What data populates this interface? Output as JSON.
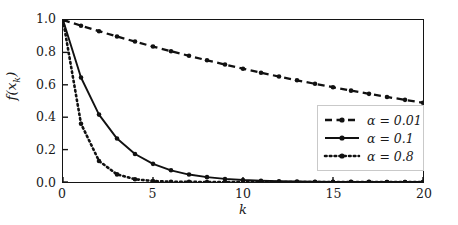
{
  "chart_data": {
    "type": "line",
    "title": "",
    "xlabel": "k",
    "ylabel": "f(x_k)",
    "ylabel_base": "f(x",
    "ylabel_sub": "k",
    "ylabel_tail": ")",
    "xlim": [
      0,
      20
    ],
    "ylim": [
      0.0,
      1.0
    ],
    "grid": false,
    "legend_position": "lower right",
    "xticks": [
      0,
      5,
      10,
      15,
      20
    ],
    "xtick_labels": [
      "0",
      "5",
      "10",
      "15",
      "20"
    ],
    "yticks": [
      0.0,
      0.2,
      0.4,
      0.6,
      0.8,
      1.0
    ],
    "ytick_labels": [
      "0.0",
      "0.2",
      "0.4",
      "0.6",
      "0.8",
      "1.0"
    ],
    "x": [
      0,
      1,
      2,
      3,
      4,
      5,
      6,
      7,
      8,
      9,
      10,
      11,
      12,
      13,
      14,
      15,
      16,
      17,
      18,
      19,
      20
    ],
    "series": [
      {
        "name": "alpha = 0.01",
        "legend_label": "α = 0.01",
        "linestyle": "dashed",
        "marker": "circle",
        "color": "#111111",
        "values": [
          1.0,
          0.965,
          0.931,
          0.898,
          0.867,
          0.836,
          0.807,
          0.779,
          0.751,
          0.725,
          0.699,
          0.675,
          0.651,
          0.628,
          0.606,
          0.585,
          0.564,
          0.544,
          0.525,
          0.507,
          0.489
        ]
      },
      {
        "name": "alpha = 0.1",
        "legend_label": "α = 0.1",
        "linestyle": "solid",
        "marker": "circle",
        "color": "#111111",
        "values": [
          1.0,
          0.645,
          0.416,
          0.268,
          0.173,
          0.112,
          0.072,
          0.046,
          0.03,
          0.019,
          0.012,
          0.008,
          0.005,
          0.003,
          0.002,
          0.001,
          0.001,
          0.001,
          0.0,
          0.0,
          0.0
        ]
      },
      {
        "name": "alpha = 0.8",
        "legend_label": "α = 0.8",
        "linestyle": "dotted",
        "marker": "circle",
        "color": "#111111",
        "values": [
          1.0,
          0.36,
          0.13,
          0.047,
          0.017,
          0.006,
          0.002,
          0.001,
          0.0,
          0.0,
          0.0,
          0.0,
          0.0,
          0.0,
          0.0,
          0.0,
          0.0,
          0.0,
          0.0,
          0.0,
          0.0
        ]
      }
    ]
  },
  "legend": {
    "entries": [
      {
        "label": "α = 0.01",
        "style": "dashed"
      },
      {
        "label": "α = 0.1",
        "style": "solid"
      },
      {
        "label": "α = 0.8",
        "style": "dotted"
      }
    ]
  },
  "axes": {
    "x_axis_label": "k",
    "y_axis_label": "f(x_k)"
  }
}
